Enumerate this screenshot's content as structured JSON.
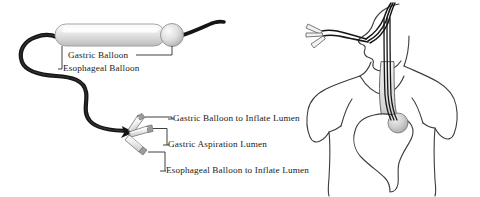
{
  "figure": {
    "background_color": "#ffffff",
    "line_color": "#1f1f1f",
    "anatomy_line_color": "#3c3c3c",
    "balloon_fill": "#e2e2e2",
    "text_color": "#1a1a1a"
  },
  "device_labels": {
    "gastric_balloon": "Gastric Balloon",
    "esophageal_balloon": "Esophageal Balloon"
  },
  "lumen_labels": {
    "gastric_balloon_inflate": "Gastric Balloon to Inflate Lumen",
    "gastric_aspiration": "Gastric Aspiration Lumen",
    "esophageal_balloon_inflate": "Esophageal Balloon to Inflate Lumen"
  },
  "parts": {
    "esophageal_balloon_shape": "elongated-cylinder-balloon",
    "gastric_balloon_shape": "small-sphere-balloon",
    "tube_shape": "curved-black-tube",
    "connector_count": 3,
    "connector_shape": "tapered-conical-port"
  },
  "anatomy": {
    "torso": "human-upper-body-outline",
    "head": "head-profile-facing-left",
    "esophagus": "esophagus-channel",
    "stomach": "stomach-outline",
    "placed_balloon": "gastric-balloon-in-stomach",
    "inserted_tube": "tube-through-nose-into-stomach",
    "external_connectors": "three-external-connector-ports"
  }
}
